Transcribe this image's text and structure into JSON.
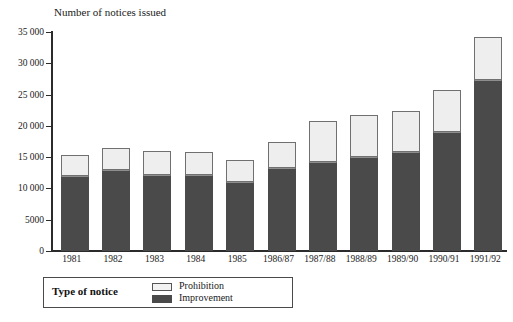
{
  "chart_data": {
    "type": "bar",
    "stacked": true,
    "title": "Number of notices issued",
    "xlabel": "",
    "ylabel": "",
    "ylim": [
      0,
      35000
    ],
    "yticks": [
      0,
      5000,
      10000,
      15000,
      20000,
      25000,
      30000,
      35000
    ],
    "ytick_labels": [
      "0",
      "5000",
      "10 000",
      "15 000",
      "20 000",
      "25 000",
      "30 000",
      "35 000"
    ],
    "grid": false,
    "legend_position": "below-plot-left",
    "legend_title": "Type of notice",
    "categories": [
      "1981",
      "1982",
      "1983",
      "1984",
      "1985",
      "1986/87",
      "1987/88",
      "1988/89",
      "1989/90",
      "1990/91",
      "1991/92"
    ],
    "series": [
      {
        "name": "Improvement",
        "color": "#4a4a4a",
        "values": [
          12000,
          13000,
          12100,
          12100,
          11100,
          13200,
          14200,
          15100,
          15800,
          19000,
          27300
        ]
      },
      {
        "name": "Prohibition",
        "color": "#eeeeee",
        "values": [
          3300,
          3400,
          3900,
          3800,
          3400,
          4300,
          6600,
          6600,
          6500,
          6800,
          6900
        ]
      }
    ],
    "totals": [
      15300,
      16400,
      16000,
      15900,
      14500,
      17500,
      20800,
      21700,
      22300,
      25800,
      34200
    ]
  },
  "legend": {
    "title": "Type of notice",
    "entries": [
      {
        "label": "Prohibition",
        "swatch": "light"
      },
      {
        "label": "Improvement",
        "swatch": "dark"
      }
    ]
  }
}
